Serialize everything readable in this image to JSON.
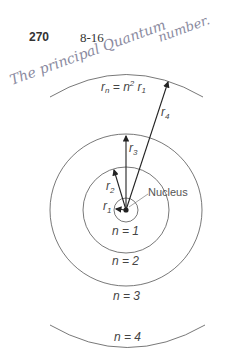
{
  "header": {
    "page_number": "270",
    "figure_number": "8-16"
  },
  "handwriting": {
    "line1": "The principal Quantum",
    "line2": "number."
  },
  "diagram": {
    "formula_label": "rn = n² r1",
    "formula_r": "r",
    "formula_sub_n": "n",
    "formula_eq": " = n",
    "formula_sup": "2",
    "formula_r1": " r",
    "formula_sub_1": "1",
    "nucleus_label": "Nucleus",
    "radius_labels": [
      {
        "r": "r",
        "sub": "1"
      },
      {
        "r": "r",
        "sub": "2"
      },
      {
        "r": "r",
        "sub": "3"
      },
      {
        "r": "r",
        "sub": "4"
      }
    ],
    "orbit_labels": [
      "n = 1",
      "n = 2",
      "n = 3",
      "n = 4"
    ]
  }
}
